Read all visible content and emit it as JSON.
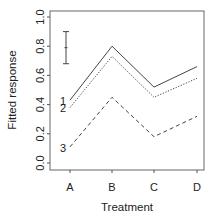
{
  "chart_data": {
    "type": "line",
    "title": "",
    "xlabel": "Treatment",
    "ylabel": "Fitted response",
    "categories": [
      "A",
      "B",
      "C",
      "D"
    ],
    "ylim": [
      0.0,
      1.0
    ],
    "yticks": [
      "0.0",
      "0.2",
      "0.4",
      "0.6",
      "0.8",
      "1.0"
    ],
    "grid": false,
    "legend": "none (series labeled inline at left: 1, 2, 3)",
    "series": [
      {
        "name": "1",
        "style": "solid",
        "values": [
          0.43,
          0.8,
          0.52,
          0.66
        ]
      },
      {
        "name": "2",
        "style": "dotted",
        "values": [
          0.38,
          0.73,
          0.45,
          0.58
        ]
      },
      {
        "name": "3",
        "style": "dashed",
        "values": [
          0.11,
          0.45,
          0.18,
          0.32
        ]
      }
    ],
    "annotations": [
      {
        "type": "error_bar",
        "center": 0.79,
        "lower": 0.68,
        "upper": 0.9,
        "position": "top-left, left of A"
      }
    ]
  },
  "colors": {
    "line": "#444444",
    "axis": "#555555",
    "text": "#222222"
  }
}
